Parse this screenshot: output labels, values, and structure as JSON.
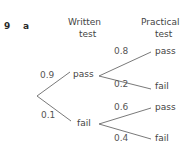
{
  "question": {
    "number": "9",
    "part": "a"
  },
  "headers": {
    "stage1": {
      "line1": "Written",
      "line2": "test"
    },
    "stage2": {
      "line1": "Practical",
      "line2": "test"
    }
  },
  "tree": {
    "stage1": [
      {
        "outcome": "pass",
        "probability": "0.9"
      },
      {
        "outcome": "fail",
        "probability": "0.1"
      }
    ],
    "stage2": {
      "after_pass": [
        {
          "outcome": "pass",
          "probability": "0.8"
        },
        {
          "outcome": "fail",
          "probability": "0.2"
        }
      ],
      "after_fail": [
        {
          "outcome": "pass",
          "probability": "0.6"
        },
        {
          "outcome": "fail",
          "probability": "0.4"
        }
      ]
    }
  },
  "colors": {
    "line": "#6a6a6a",
    "text": "#444444"
  }
}
